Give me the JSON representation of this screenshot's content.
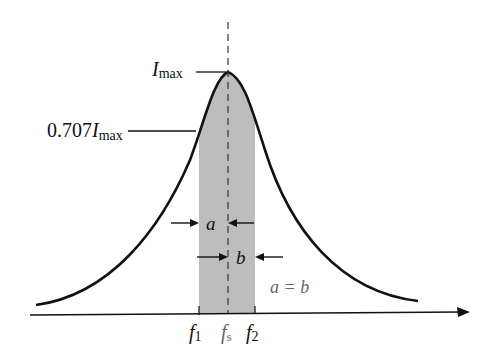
{
  "diagram": {
    "labels": {
      "imax_main": "I",
      "imax_sub": "max",
      "half_power_coef": "0.707",
      "half_power_main": "I",
      "half_power_sub": "max",
      "a": "a",
      "b": "b",
      "equality": "a = b",
      "f1_main": "f",
      "f1_sub": "1",
      "fs_main": "f",
      "fs_sub": "s",
      "f2_main": "f",
      "f2_sub": "2"
    },
    "colors": {
      "curve": "#111111",
      "band_fill": "#bdbdbd",
      "axis": "#111111",
      "equality_text": "#666666"
    }
  }
}
